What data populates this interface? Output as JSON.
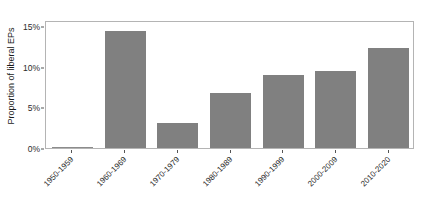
{
  "chart_data": {
    "type": "bar",
    "title": "",
    "subtitle": "",
    "xlabel": "",
    "ylabel": "Proportion of liberal EPs",
    "categories": [
      "1950-1959",
      "1960-1969",
      "1970-1979",
      "1980-1989",
      "1990-1999",
      "2000-2009",
      "2010-2020"
    ],
    "values": [
      0.0,
      14.5,
      3.1,
      6.8,
      9.0,
      9.5,
      12.4
    ],
    "value_labels": [
      "0%",
      "14.5%",
      "3.1%",
      "6.8%",
      "9.0%",
      "9.5%",
      "12.4%"
    ],
    "ylim": [
      0,
      15.8
    ],
    "yticks": [
      0,
      5,
      10,
      15
    ],
    "ytick_labels": [
      "0%",
      "5%",
      "10%",
      "15%"
    ],
    "grid": false,
    "legend": null,
    "bar_color": "#808080",
    "panel_border_color": "#b4b4b4",
    "background_color": "#ffffff",
    "axis_text_color": "#2b2b2b"
  }
}
